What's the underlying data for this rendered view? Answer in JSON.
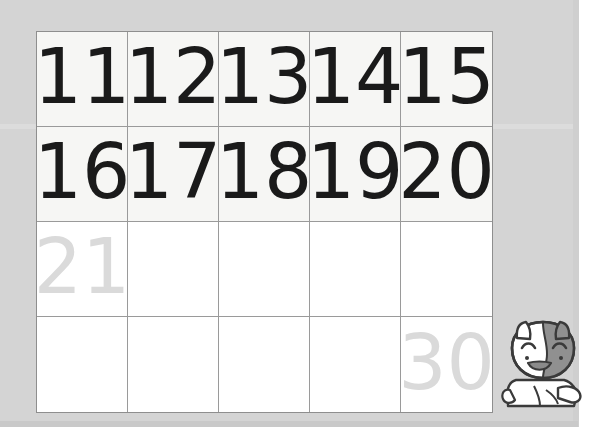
{
  "worksheet": {
    "title": "Number chart 11-30 practice worksheet",
    "background_color": "#d4d4d4",
    "grid_border_color": "#8e8e8e",
    "shaded_row_color": "#f6f6f4",
    "plain_row_color": "#ffffff",
    "ink_color": "#1a1a1a",
    "trace_color": "#dadada",
    "columns": 5,
    "rows": 4
  },
  "grid": {
    "rows": [
      {
        "index": 1,
        "shaded": true,
        "cells": [
          {
            "value": "11",
            "style": "ink"
          },
          {
            "value": "12",
            "style": "ink"
          },
          {
            "value": "13",
            "style": "ink"
          },
          {
            "value": "14",
            "style": "ink"
          },
          {
            "value": "15",
            "style": "ink"
          }
        ]
      },
      {
        "index": 2,
        "shaded": true,
        "cells": [
          {
            "value": "16",
            "style": "ink"
          },
          {
            "value": "17",
            "style": "ink"
          },
          {
            "value": "18",
            "style": "ink"
          },
          {
            "value": "19",
            "style": "ink"
          },
          {
            "value": "20",
            "style": "ink"
          }
        ]
      },
      {
        "index": 3,
        "shaded": false,
        "cells": [
          {
            "value": "21",
            "style": "trace"
          },
          {
            "value": "",
            "style": "blank"
          },
          {
            "value": "",
            "style": "blank"
          },
          {
            "value": "",
            "style": "blank"
          },
          {
            "value": "",
            "style": "blank"
          }
        ]
      },
      {
        "index": 4,
        "shaded": false,
        "cells": [
          {
            "value": "",
            "style": "blank"
          },
          {
            "value": "",
            "style": "blank"
          },
          {
            "value": "",
            "style": "blank"
          },
          {
            "value": "",
            "style": "blank"
          },
          {
            "value": "30",
            "style": "trace"
          }
        ]
      }
    ]
  },
  "mascot": {
    "name": "cat-mascot",
    "description": "white cartoon cat with gray patch over its left face, winking eyes and open smile",
    "body_color": "#ffffff",
    "patch_color": "#909090",
    "outline_color": "#3a3a3a"
  }
}
